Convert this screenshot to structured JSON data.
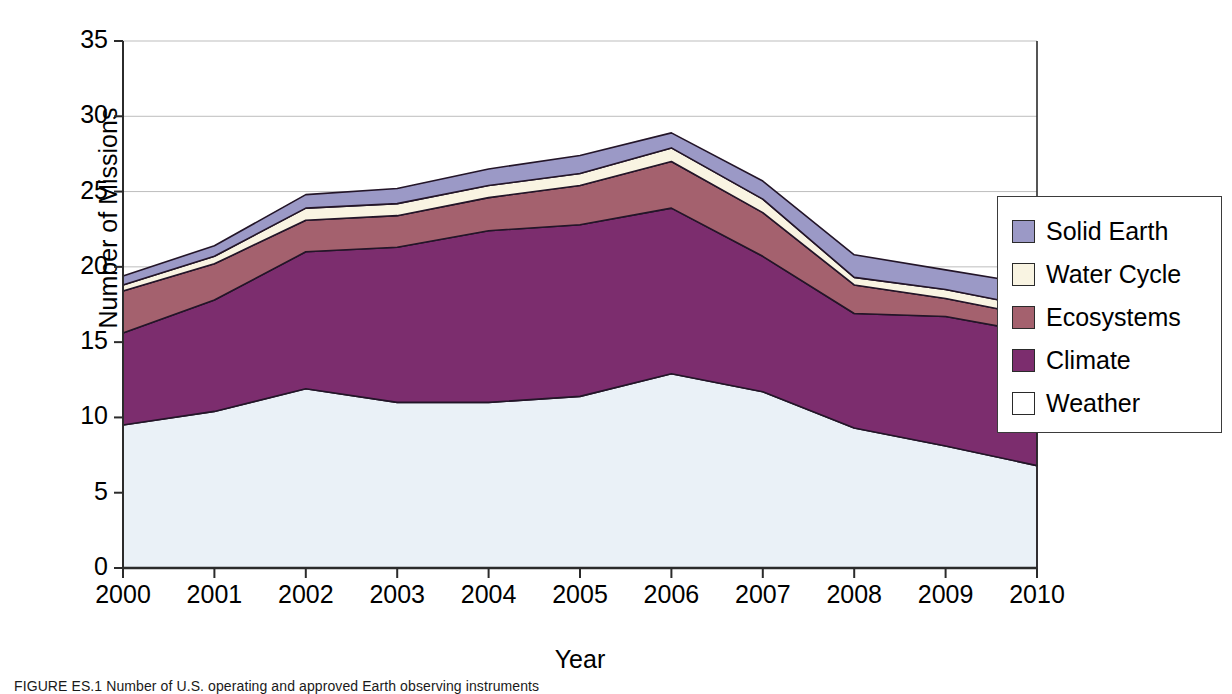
{
  "chart_data": {
    "type": "area",
    "stacked": true,
    "title": "",
    "xlabel": "Year",
    "ylabel": "Number of Missions",
    "categories": [
      "2000",
      "2001",
      "2002",
      "2003",
      "2004",
      "2005",
      "2006",
      "2007",
      "2008",
      "2009",
      "2010"
    ],
    "x": [
      2000,
      2001,
      2002,
      2003,
      2004,
      2005,
      2006,
      2007,
      2008,
      2009,
      2010
    ],
    "ylim": [
      0,
      35
    ],
    "yticks": [
      "0",
      "5",
      "10",
      "15",
      "20",
      "25",
      "30",
      "35"
    ],
    "ytick_values": [
      0,
      5,
      10,
      15,
      20,
      25,
      30,
      35
    ],
    "grid": "horizontal",
    "legend_position": "right",
    "series": [
      {
        "name": "Weather",
        "color": "#eaf1f7",
        "values": [
          9.5,
          10.4,
          11.9,
          11.0,
          11.0,
          11.4,
          12.9,
          11.7,
          9.3,
          8.1,
          6.8
        ]
      },
      {
        "name": "Climate",
        "color": "#7c2d6e",
        "values": [
          6.1,
          7.4,
          9.1,
          10.3,
          11.4,
          11.4,
          11.0,
          9.0,
          7.6,
          8.6,
          8.8
        ]
      },
      {
        "name": "Ecosystems",
        "color": "#a4616e",
        "values": [
          2.8,
          2.4,
          2.1,
          2.1,
          2.2,
          2.6,
          3.1,
          2.9,
          1.9,
          1.2,
          1.1
        ]
      },
      {
        "name": "Water Cycle",
        "color": "#f9f4e2",
        "values": [
          0.4,
          0.5,
          0.8,
          0.8,
          0.8,
          0.8,
          0.9,
          0.9,
          0.5,
          0.6,
          0.6
        ]
      },
      {
        "name": "Solid Earth",
        "color": "#9b99c6",
        "values": [
          0.6,
          0.7,
          0.9,
          1.0,
          1.1,
          1.2,
          1.0,
          1.2,
          1.5,
          1.3,
          1.5
        ]
      }
    ],
    "totals": [
      19.4,
      21.4,
      24.8,
      25.2,
      26.5,
      27.4,
      28.9,
      25.7,
      20.8,
      19.8,
      18.8
    ]
  },
  "axes": {
    "y_label": "Number of Missions",
    "x_label": "Year"
  },
  "legend": {
    "entries": [
      {
        "label": "Solid Earth",
        "color": "#9b99c6"
      },
      {
        "label": "Water Cycle",
        "color": "#f9f4e2"
      },
      {
        "label": "Ecosystems",
        "color": "#a4616e"
      },
      {
        "label": "Climate",
        "color": "#7c2d6e"
      },
      {
        "label": "Weather",
        "color": "#ffffff"
      }
    ]
  },
  "caption": {
    "text": "FIGURE ES.1  Number of U.S. operating and approved Earth observing instruments"
  },
  "colors": {
    "axis": "#2b2b2b",
    "grid": "#bdbdbd",
    "outline": "#231528",
    "background": "#ffffff"
  }
}
